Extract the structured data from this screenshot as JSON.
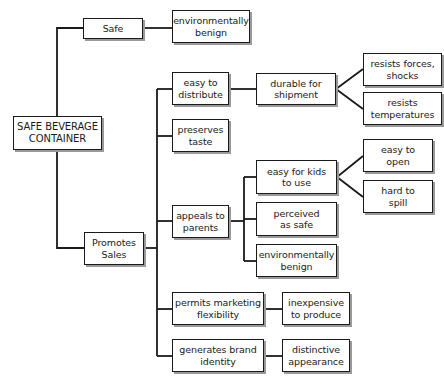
{
  "diagram": {
    "type": "tree",
    "root": {
      "id": "root",
      "lines": [
        "SAFE BEVERAGE",
        "CONTAINER"
      ]
    },
    "nodes": {
      "safe": {
        "lines": [
          "Safe"
        ],
        "parent": "root"
      },
      "safe_env": {
        "lines": [
          "environmentally",
          "benign"
        ],
        "parent": "safe"
      },
      "promotes": {
        "lines": [
          "Promotes",
          "Sales"
        ],
        "parent": "root"
      },
      "distribute": {
        "lines": [
          "easy to",
          "distribute"
        ],
        "parent": "promotes"
      },
      "durable": {
        "lines": [
          "durable for",
          "shipment"
        ],
        "parent": "distribute"
      },
      "forces": {
        "lines": [
          "resists forces,",
          "shocks"
        ],
        "parent": "durable"
      },
      "temps": {
        "lines": [
          "resists",
          "temperatures"
        ],
        "parent": "durable"
      },
      "taste": {
        "lines": [
          "preserves",
          "taste"
        ],
        "parent": "promotes"
      },
      "parents": {
        "lines": [
          "appeals to",
          "parents"
        ],
        "parent": "promotes"
      },
      "kids": {
        "lines": [
          "easy for kids",
          "to use"
        ],
        "parent": "parents"
      },
      "open": {
        "lines": [
          "easy to",
          "open"
        ],
        "parent": "kids"
      },
      "spill": {
        "lines": [
          "hard to",
          "spill"
        ],
        "parent": "kids"
      },
      "perceived": {
        "lines": [
          "perceived",
          "as safe"
        ],
        "parent": "parents"
      },
      "parents_env": {
        "lines": [
          "environmentally",
          "benign"
        ],
        "parent": "parents"
      },
      "marketing": {
        "lines": [
          "permits marketing",
          "flexibility"
        ],
        "parent": "promotes"
      },
      "inexpensive": {
        "lines": [
          "inexpensive",
          "to produce"
        ],
        "parent": "marketing"
      },
      "brand": {
        "lines": [
          "generates brand",
          "identity"
        ],
        "parent": "promotes"
      },
      "distinctive": {
        "lines": [
          "distinctive",
          "appearance"
        ],
        "parent": "brand"
      }
    }
  },
  "colors": {
    "line": "#1a1a1a",
    "box_border": "#1a1a1a",
    "shadow": "#9a9a9a",
    "background": "#ffffff"
  }
}
